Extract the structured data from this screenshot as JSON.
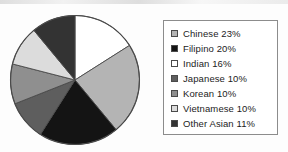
{
  "chart_data": {
    "type": "pie",
    "title": "",
    "subtitle": "",
    "xlabel": "",
    "ylabel": "",
    "legend_position": "right",
    "grid": false,
    "start_angle_deg": 0,
    "direction": "clockwise",
    "categories": [
      "Chinese",
      "Filipino",
      "Indian",
      "Japanese",
      "Korean",
      "Vietnamese",
      "Other Asian"
    ],
    "values": [
      23,
      20,
      16,
      10,
      10,
      10,
      11
    ],
    "unit": "%",
    "slice_order_clockwise_from_top": [
      "Indian",
      "Chinese",
      "Filipino",
      "Japanese",
      "Korean",
      "Vietnamese",
      "Other Asian"
    ],
    "slices": [
      {
        "label": "Chinese",
        "value": 23,
        "display": "Chinese 23%",
        "color": "#b4b4b4"
      },
      {
        "label": "Filipino",
        "value": 20,
        "display": "Filipino 20%",
        "color": "#141414"
      },
      {
        "label": "Indian",
        "value": 16,
        "display": "Indian 16%",
        "color": "#ffffff"
      },
      {
        "label": "Japanese",
        "value": 10,
        "display": "Japanese 10%",
        "color": "#5e5e5e"
      },
      {
        "label": "Korean",
        "value": 10,
        "display": "Korean 10%",
        "color": "#8f8f8f"
      },
      {
        "label": "Vietnamese",
        "value": 10,
        "display": "Vietnamese 10%",
        "color": "#dcdcdc"
      },
      {
        "label": "Other Asian",
        "value": 11,
        "display": "Other Asian 11%",
        "color": "#333333"
      }
    ]
  },
  "legend": {
    "items": [
      {
        "label": "Chinese 23%",
        "swatch_color": "#b4b4b4"
      },
      {
        "label": "Filipino 20%",
        "swatch_color": "#141414"
      },
      {
        "label": "Indian 16%",
        "swatch_color": "#ffffff"
      },
      {
        "label": "Japanese 10%",
        "swatch_color": "#5e5e5e"
      },
      {
        "label": "Korean 10%",
        "swatch_color": "#8f8f8f"
      },
      {
        "label": "Vietnamese 10%",
        "swatch_color": "#dcdcdc"
      },
      {
        "label": "Other Asian 11%",
        "swatch_color": "#333333"
      }
    ]
  },
  "style": {
    "pie_outline": "#4a4a4a",
    "legend_border": "#8c8c8c",
    "text_color": "#1c1c1c",
    "background": "#fdfdfd"
  }
}
